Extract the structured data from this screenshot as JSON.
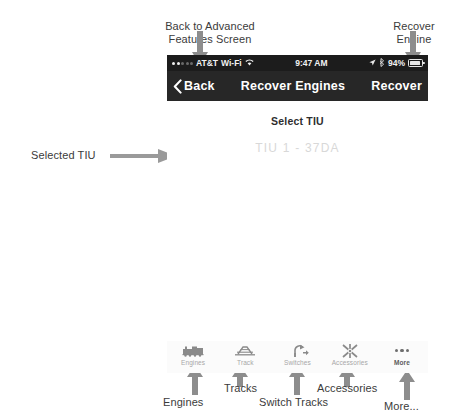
{
  "annotations": {
    "top_left": "Back to Advanced\nFeatures Screen",
    "top_right": "Recover\nEngine",
    "left_mid": "Selected TIU",
    "bottom": [
      {
        "label": "Engines"
      },
      {
        "label": "Tracks"
      },
      {
        "label": "Switch Tracks"
      },
      {
        "label": "Accessories"
      },
      {
        "label": "More..."
      }
    ]
  },
  "screen": {
    "status_bar": {
      "signal_dots": 5,
      "signal_filled": 2,
      "carrier": "AT&T",
      "network": "Wi-Fi",
      "wifi_icon": "wifi-icon",
      "time": "9:47 AM",
      "location_icon": "location-arrow-icon",
      "bluetooth_icon": "bluetooth-icon",
      "battery_percent": "94%",
      "battery_level": 94
    },
    "nav_bar": {
      "back_label": "Back",
      "back_icon": "chevron-left-icon",
      "title": "Recover Engines",
      "action_label": "Recover"
    },
    "content": {
      "section_label": "Select TIU",
      "tiu_value": "TIU 1 - 37DA"
    },
    "tab_bar": {
      "tabs": [
        {
          "label": "Engines",
          "icon": "locomotive-icon",
          "active": false
        },
        {
          "label": "Track",
          "icon": "track-icon",
          "active": false
        },
        {
          "label": "Switches",
          "icon": "switch-icon",
          "active": false
        },
        {
          "label": "Accessories",
          "icon": "accessory-icon",
          "active": false
        },
        {
          "label": "More",
          "icon": "ellipsis-icon",
          "active": true
        }
      ]
    }
  },
  "colors": {
    "status_bar_bg": "#1c1c1c",
    "nav_bar_bg": "#272727",
    "nav_text": "#ffffff",
    "tiu_value_text": "#d8d8d8",
    "annotation_text": "#3b3b3b",
    "tab_label": "#a7a7a7",
    "tab_label_active": "#5c5c5c"
  }
}
